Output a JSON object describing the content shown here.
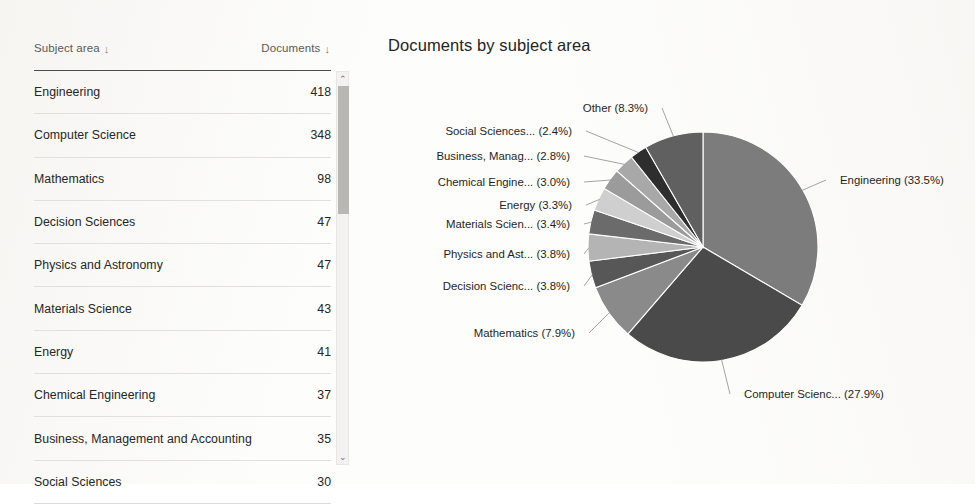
{
  "table": {
    "headers": {
      "subject": "Subject area",
      "documents": "Documents",
      "sort_icon": "↓"
    },
    "rows": [
      {
        "subject": "Engineering",
        "documents": "418"
      },
      {
        "subject": "Computer Science",
        "documents": "348"
      },
      {
        "subject": "Mathematics",
        "documents": "98"
      },
      {
        "subject": "Decision Sciences",
        "documents": "47"
      },
      {
        "subject": "Physics and Astronomy",
        "documents": "47"
      },
      {
        "subject": "Materials Science",
        "documents": "43"
      },
      {
        "subject": "Energy",
        "documents": "41"
      },
      {
        "subject": "Chemical Engineering",
        "documents": "37"
      },
      {
        "subject": "Business, Management and Accounting",
        "documents": "35"
      },
      {
        "subject": "Social Sciences",
        "documents": "30"
      }
    ],
    "scrollbar": {
      "up_icon": "⌃",
      "down_icon": "⌄"
    }
  },
  "chart_data": {
    "type": "pie",
    "title": "Documents by subject area",
    "xlabel": "",
    "ylabel": "",
    "legend_position": "none",
    "grid": false,
    "labels": [
      "Engineering",
      "Computer Scienc...",
      "Mathematics",
      "Decision Scienc...",
      "Physics and Ast...",
      "Materials Scien...",
      "Energy",
      "Chemical Engine...",
      "Business, Manag...",
      "Social Sciences...",
      "Other"
    ],
    "percents": [
      33.5,
      27.9,
      7.9,
      3.8,
      3.8,
      3.4,
      3.3,
      3.0,
      2.8,
      2.4,
      8.3
    ],
    "values": [
      418,
      348,
      98,
      47,
      47,
      43,
      41,
      37,
      35,
      30,
      104
    ],
    "annotations": [
      "Engineering (33.5%)",
      "Computer Scienc... (27.9%)",
      "Mathematics (7.9%)",
      "Decision Scienc... (3.8%)",
      "Physics and Ast... (3.8%)",
      "Materials Scien... (3.4%)",
      "Energy (3.3%)",
      "Chemical Engine... (3.0%)",
      "Business, Manag... (2.8%)",
      "Social Sciences... (2.4%)",
      "Other (8.3%)"
    ],
    "colors": [
      "#7c7c7c",
      "#4a4a4a",
      "#8a8a8a",
      "#575757",
      "#b4b4b4",
      "#6b6b6b",
      "#cfcfcf",
      "#9b9b9b",
      "#a8a8a8",
      "#2e2e2e",
      "#606060"
    ]
  }
}
